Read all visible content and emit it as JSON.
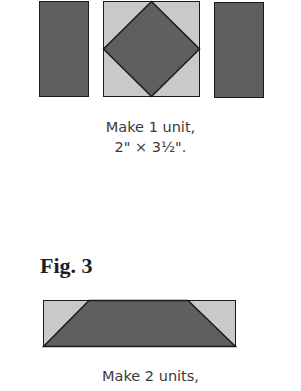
{
  "figure2": {
    "caption_line1": "Make 1 unit,",
    "caption_line2": "2\" × 3½\"."
  },
  "figure3": {
    "label": "Fig. 3",
    "caption_line1": "Make 2 units,"
  },
  "colors": {
    "dark_fabric": "#5f5f5f",
    "light_fabric": "#c9c9c9",
    "outline": "#1a1a1a"
  }
}
